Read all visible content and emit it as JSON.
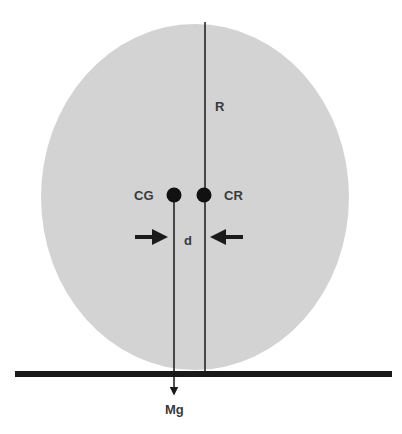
{
  "diagram": {
    "type": "free-body diagram",
    "labels": {
      "radius": "R",
      "center_of_gravity": "CG",
      "center_of_rotation": "CR",
      "offset": "d",
      "weight_force": "Mg"
    },
    "colors": {
      "body_fill": "#d3d3d3",
      "line": "#1a1a1a",
      "text": "#3a3a3a",
      "background": "#ffffff"
    }
  }
}
